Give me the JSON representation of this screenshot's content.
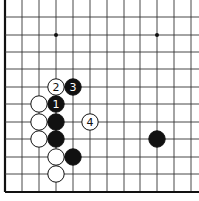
{
  "board": {
    "description": "Go board corner diagram (lower-left corner, left and bottom edges)",
    "grid_x": [
      5,
      22,
      39,
      56,
      73,
      90,
      107,
      124,
      140,
      157,
      174,
      191
    ],
    "grid_y": [
      0,
      17,
      35,
      52,
      69,
      87,
      104,
      122,
      139,
      157,
      174,
      192
    ],
    "star_points": [
      [
        56,
        35
      ],
      [
        157,
        35
      ]
    ],
    "line_color": "#333333",
    "edge_color": "#111111"
  },
  "stones": [
    {
      "color": "white",
      "x": 56,
      "y": 87,
      "label": "2"
    },
    {
      "color": "black",
      "x": 73,
      "y": 87,
      "label": "3"
    },
    {
      "color": "black",
      "x": 56,
      "y": 104,
      "label": "1"
    },
    {
      "color": "white",
      "x": 39,
      "y": 104,
      "label": ""
    },
    {
      "color": "white",
      "x": 39,
      "y": 122,
      "label": ""
    },
    {
      "color": "black",
      "x": 56,
      "y": 122,
      "label": ""
    },
    {
      "color": "white",
      "x": 90,
      "y": 122,
      "label": "4"
    },
    {
      "color": "white",
      "x": 39,
      "y": 139,
      "label": ""
    },
    {
      "color": "black",
      "x": 56,
      "y": 139,
      "label": ""
    },
    {
      "color": "white",
      "x": 56,
      "y": 157,
      "label": ""
    },
    {
      "color": "black",
      "x": 73,
      "y": 157,
      "label": ""
    },
    {
      "color": "white",
      "x": 56,
      "y": 174,
      "label": ""
    },
    {
      "color": "black",
      "x": 157,
      "y": 139,
      "label": ""
    }
  ]
}
